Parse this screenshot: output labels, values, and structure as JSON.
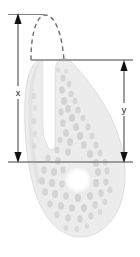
{
  "figure": {
    "type": "biological-diagram",
    "title": "",
    "background_color": "#ffffff",
    "organism": {
      "name": "comma-shaped-organism",
      "body_fill": "#ececec",
      "body_stroke": "#d8d8d8",
      "texture_fill": "#cfcfcf",
      "nucleus_fill": "#ffffff",
      "notch_fill": "#ffffff"
    },
    "annotations": {
      "measurement_x": {
        "label": "x",
        "description": "total-height-dimension",
        "color": "#4d4d4d",
        "orientation": "vertical",
        "side": "left"
      },
      "measurement_y": {
        "label": "y",
        "description": "partial-height-dimension",
        "color": "#4d4d4d",
        "orientation": "vertical",
        "side": "right"
      },
      "dashed_arc": {
        "label": "",
        "description": "projected-outline-arc",
        "style": "dashed",
        "color": "#6e6e6e"
      },
      "reference_lines": {
        "top_line": "",
        "middle_line": "",
        "bottom_line": "",
        "color": "#808080"
      }
    }
  }
}
